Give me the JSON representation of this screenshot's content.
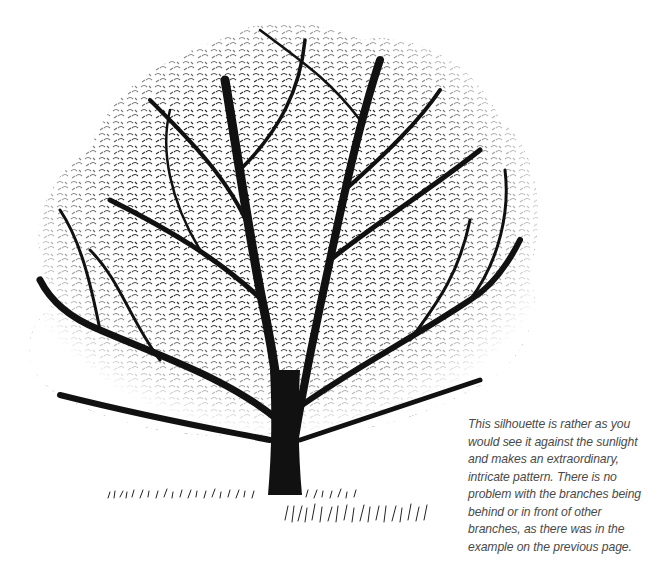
{
  "illustration": {
    "subject": "tree-silhouette",
    "ink_color": "#111111",
    "background_color": "#ffffff"
  },
  "caption": {
    "lines": [
      "This silhouette is rather as you",
      "would see it against the sunlight",
      "and makes an extraordinary,",
      "intricate pattern. There is no",
      "problem with the branches being",
      "behind or in front of other",
      "branches, as there was in the",
      "example on the previous page."
    ]
  }
}
